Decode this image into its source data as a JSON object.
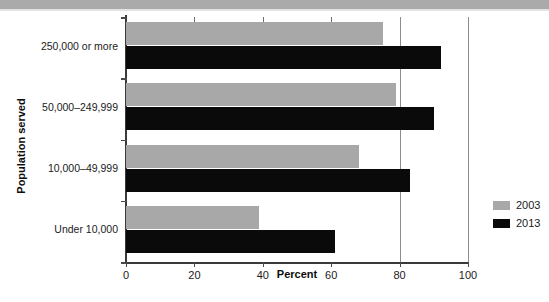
{
  "chart_data": {
    "type": "bar",
    "orientation": "horizontal",
    "title": "",
    "xlabel": "Percent",
    "ylabel": "Population served",
    "categories": [
      "250,000 or more",
      "50,000–249,999",
      "10,000–49,999",
      "Under 10,000"
    ],
    "series": [
      {
        "name": "2003",
        "color": "#a8a8a8",
        "values": [
          75,
          79,
          68,
          39
        ]
      },
      {
        "name": "2013",
        "color": "#0a0a0a",
        "values": [
          92,
          90,
          83,
          61
        ]
      }
    ],
    "xlim": [
      0,
      100
    ],
    "xticks": [
      0,
      20,
      40,
      60,
      80,
      100
    ],
    "xticklabels": [
      "0",
      "20",
      "40",
      "60",
      "80",
      "100"
    ],
    "grid": true,
    "gridlines_at": [
      80,
      100
    ],
    "legend_position": "right"
  },
  "legend": {
    "entries": [
      {
        "label": "2003",
        "color": "#a8a8a8"
      },
      {
        "label": "2013",
        "color": "#0a0a0a"
      }
    ]
  },
  "axes": {
    "x_title": "Percent",
    "y_title": "Population served"
  }
}
